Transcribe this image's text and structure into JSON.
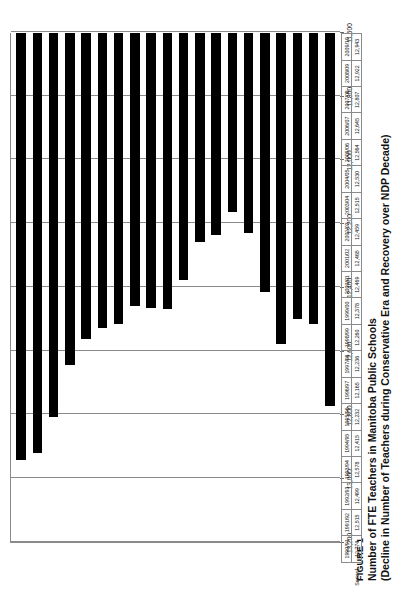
{
  "figure": {
    "label": "FIGURE 1",
    "title_line1": "Number of FTE Teachers in Manitoba Public Schools",
    "title_line2": "(Decline in Number of Teachers during Conservative Era and Recovery over NDP Decade)"
  },
  "legend": {
    "series_name": "Series1"
  },
  "chart_data": {
    "type": "bar",
    "orientation": "horizontal",
    "title": "Number of FTE Teachers in Manitoba Public Schools (Decline in Number of Teachers during Conservative Era and Recovery over NDP Decade)",
    "xlabel": "",
    "ylabel": "",
    "xlim": [
      13200,
      11600
    ],
    "axis_reversed": true,
    "grid": true,
    "legend_position": "table-below",
    "tick_labels": [
      "13,200",
      "13,000",
      "12,800",
      "12,600",
      "12,400",
      "12,200",
      "12,000",
      "11,800",
      "11,600"
    ],
    "ticks": [
      13200,
      13000,
      12800,
      12600,
      12400,
      12200,
      12000,
      11800,
      11600
    ],
    "categories": [
      "2009/10",
      "2008/09",
      "2007/08",
      "2006/07",
      "2005/06",
      "2004/05",
      "2003/04",
      "2002/03",
      "2001/02",
      "2000/01",
      "1999/00",
      "1998/99",
      "1997/98",
      "1996/97",
      "1995/96",
      "1994/95",
      "1993/94",
      "1992/93",
      "1991/92",
      "1990/91"
    ],
    "values": [
      12943,
      12922,
      12807,
      12645,
      12564,
      12530,
      12515,
      12459,
      12465,
      12469,
      12378,
      12260,
      12236,
      12165,
      12232,
      12415,
      12578,
      12499,
      12515,
      12774
    ],
    "value_labels": [
      "12,943",
      "12,922",
      "12,807",
      "12,645",
      "12,564",
      "12,530",
      "12,515",
      "12,459",
      "12,465",
      "12,469",
      "12,378",
      "12,260",
      "12,236",
      "12,165",
      "12,232",
      "12,415",
      "12,578",
      "12,499",
      "12,515",
      "12,774"
    ],
    "series": [
      {
        "name": "Series1",
        "values": [
          12943,
          12922,
          12807,
          12645,
          12564,
          12530,
          12515,
          12459,
          12465,
          12469,
          12378,
          12260,
          12236,
          12165,
          12232,
          12415,
          12578,
          12499,
          12515,
          12774
        ]
      }
    ]
  },
  "colors": {
    "bar": "#000000",
    "gridline": "#8a8a8a",
    "text": "#111111",
    "background": "#ffffff"
  }
}
